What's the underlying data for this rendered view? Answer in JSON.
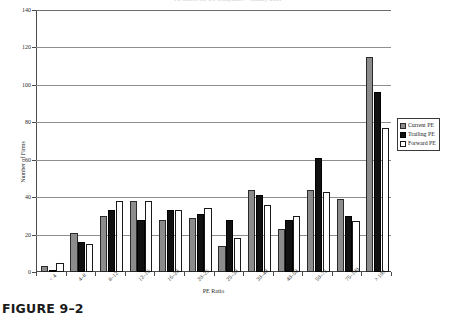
{
  "figure": {
    "caption": "FIGURE 9–2",
    "cut_off_title": "PE Ratios for US Companies – January 2001"
  },
  "legend": {
    "position": "right",
    "items": [
      {
        "label": "Current PE",
        "color": "#8c8c8c",
        "key": "current"
      },
      {
        "label": "Trailing PE",
        "color": "#111111",
        "key": "trailing"
      },
      {
        "label": "Forward PE",
        "color": "#ffffff",
        "key": "forward"
      }
    ]
  },
  "axes": {
    "y_ticks": [
      "0",
      "20",
      "40",
      "60",
      "80",
      "100",
      "120",
      "140"
    ],
    "y_title": "Number of Firms",
    "x_title": "PE Ratio"
  },
  "chart_data": {
    "type": "bar",
    "title": "",
    "xlabel": "PE Ratio",
    "ylabel": "Number of Firms",
    "ylim": [
      0,
      140
    ],
    "ytick_step": 20,
    "grid": true,
    "legend_position": "right",
    "categories": [
      "< 4",
      "4–8",
      "8–12",
      "12–16",
      "16–20",
      "20–25",
      "25–30",
      "30–40",
      "40–50",
      "50–75",
      "75–100",
      "> 100"
    ],
    "series": [
      {
        "name": "Current PE",
        "color": "#8c8c8c",
        "values": [
          3,
          21,
          30,
          38,
          28,
          29,
          14,
          44,
          23,
          44,
          39,
          115
        ]
      },
      {
        "name": "Trailing PE",
        "color": "#111111",
        "values": [
          1,
          16,
          33,
          28,
          33,
          31,
          28,
          41,
          28,
          61,
          30,
          96
        ]
      },
      {
        "name": "Forward PE",
        "color": "#ffffff",
        "values": [
          5,
          15,
          38,
          38,
          33,
          34,
          18,
          36,
          30,
          43,
          27,
          77
        ]
      }
    ]
  }
}
